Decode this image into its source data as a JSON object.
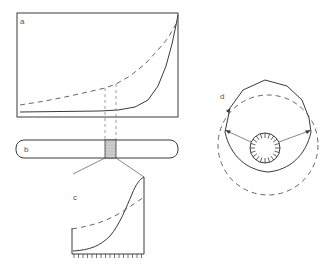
{
  "figure": {
    "panels": [
      {
        "id": "a",
        "label": "a",
        "description": "Exponential solid curve and gentler dashed curve in rectangular frame"
      },
      {
        "id": "b",
        "label": "b",
        "description": "Rounded bar with stippled highlighted segment"
      },
      {
        "id": "c",
        "label": "c",
        "description": "Magnified segment: sigmoid solid curve and dashed curve, tick marks on base"
      },
      {
        "id": "d",
        "label": "d",
        "description": "Polygon outline with dashed circle, inner toothed circle and two arrows"
      }
    ],
    "colors": {
      "line": "#3a3a3a",
      "dash": "#555555",
      "stipple": "#9a9a9a",
      "background": "#ffffff"
    },
    "panel_c": {
      "tick_count": 16
    },
    "panel_d": {
      "inner_teeth": 20
    }
  }
}
